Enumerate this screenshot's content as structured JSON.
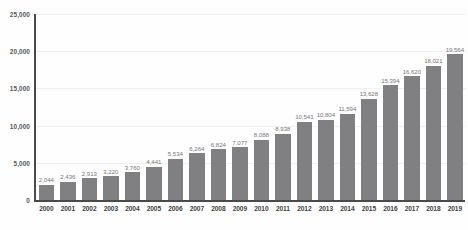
{
  "chart_data": {
    "type": "bar",
    "title": "",
    "subtitle": "",
    "xlabel": "",
    "ylabel": "",
    "grid": true,
    "legend": "none",
    "ylim": [
      0,
      25000
    ],
    "ytick_labels": [
      "0",
      "5,000",
      "10,000",
      "15,000",
      "20,000",
      "25,000"
    ],
    "ytick_values": [
      0,
      5000,
      10000,
      15000,
      20000,
      25000
    ],
    "categories": [
      "2000",
      "2001",
      "2002",
      "2003",
      "2004",
      "2005",
      "2006",
      "2007",
      "2008",
      "2009",
      "2010",
      "2011",
      "2012",
      "2013",
      "2014",
      "2015",
      "2016",
      "2017",
      "2018",
      "2019"
    ],
    "values": [
      2044,
      2436,
      2913,
      3220,
      3760,
      4441,
      5534,
      6264,
      6824,
      7077,
      8088,
      8938,
      10541,
      10804,
      11594,
      13628,
      15394,
      16620,
      18021,
      19564
    ],
    "data_labels": [
      "2,044",
      "2,436",
      "2,913",
      "3,220",
      "3,760",
      "4,441",
      "5,534",
      "6,264",
      "6,824",
      "7,077",
      "8,088",
      "8,938",
      "10,541",
      "10,804",
      "11,594",
      "13,628",
      "15,394",
      "16,620",
      "18,021",
      "19,564"
    ],
    "colors": {
      "bar": "#808082",
      "axis": "#4a4a4c",
      "gridline": "#f0f0f0",
      "data_label": "#76767a",
      "tick_label": "#3f3f41",
      "y_tick_label": "#58585a",
      "background": "#fefefe"
    }
  }
}
